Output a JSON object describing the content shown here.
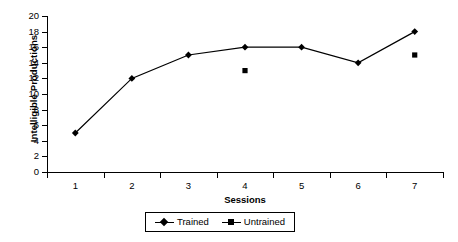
{
  "chart_data": {
    "type": "line",
    "title": "",
    "xlabel": "Sessions",
    "ylabel": "Intelligible Productions",
    "categories": [
      "1",
      "2",
      "3",
      "4",
      "5",
      "6",
      "7"
    ],
    "x": [
      1,
      2,
      3,
      4,
      5,
      6,
      7
    ],
    "ylim": [
      0,
      20
    ],
    "yticks": [
      0,
      2,
      4,
      6,
      8,
      10,
      12,
      14,
      16,
      18,
      20
    ],
    "ytick_labels": [
      "0",
      "2",
      "4",
      "6",
      "8",
      "10",
      "12",
      "14",
      "16",
      "18",
      "20"
    ],
    "grid": false,
    "legend_position": "bottom",
    "series": [
      {
        "name": "Trained",
        "marker": "diamond",
        "line": true,
        "color": "#000000",
        "values": [
          5,
          12,
          15,
          16,
          16,
          14,
          18
        ]
      },
      {
        "name": "Untrained",
        "marker": "square",
        "line": false,
        "color": "#000000",
        "values": [
          null,
          null,
          null,
          13,
          null,
          null,
          15
        ]
      }
    ]
  },
  "axes": {
    "y_title": "Intelligible Productions",
    "x_title": "Sessions"
  },
  "legend": {
    "entries": [
      {
        "label": "Trained",
        "marker": "diamond"
      },
      {
        "label": "Untrained",
        "marker": "square"
      }
    ]
  }
}
